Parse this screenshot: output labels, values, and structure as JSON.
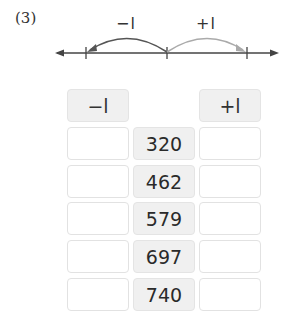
{
  "problem": {
    "number": "(3)"
  },
  "number_line": {
    "left_label": "−l",
    "right_label": "+l",
    "left_arc_color": "#555555",
    "right_arc_color": "#aaaaaa"
  },
  "table": {
    "headers": {
      "minus": "−l",
      "plus": "+l"
    },
    "rows": [
      {
        "minus": "",
        "value": "320",
        "plus": ""
      },
      {
        "minus": "",
        "value": "462",
        "plus": ""
      },
      {
        "minus": "",
        "value": "579",
        "plus": ""
      },
      {
        "minus": "",
        "value": "697",
        "plus": ""
      },
      {
        "minus": "",
        "value": "740",
        "plus": ""
      }
    ]
  }
}
